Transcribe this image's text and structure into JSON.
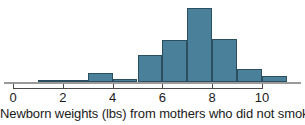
{
  "caption": "Newborn weights (lbs) from mothers who did not smoke",
  "colors": {
    "bar_fill": "#4a8099",
    "bar_stroke": "#2c4f60",
    "axis": "#4a4a4a",
    "baseline": "#9a9a9a",
    "text": "#1a1a1a",
    "background": "#ffffff"
  },
  "axis": {
    "tick_labels": [
      "0",
      "2",
      "4",
      "6",
      "8",
      "10"
    ],
    "tick_values": [
      0,
      2,
      4,
      6,
      8,
      10
    ],
    "xlim": [
      -0.4,
      11.4
    ]
  },
  "chart_data": {
    "type": "bar",
    "title": "",
    "subtitle": "",
    "xlabel": "Newborn weights (lbs) from mothers who did not smoke",
    "ylabel": "",
    "grid": false,
    "legend": "none",
    "bin_width": 1,
    "bin_edges": [
      1,
      2,
      3,
      4,
      5,
      6,
      7,
      8,
      9,
      10,
      11
    ],
    "categories": [
      "1-2",
      "2-3",
      "3-4",
      "4-5",
      "5-6",
      "6-7",
      "7-8",
      "8-9",
      "9-10",
      "10-11"
    ],
    "values": [
      2,
      2,
      9,
      3,
      28,
      44,
      77,
      45,
      14,
      6
    ],
    "ylim": [
      0,
      80
    ],
    "xlim": [
      0,
      11
    ],
    "xtick_labels": [
      "0",
      "2",
      "4",
      "6",
      "8",
      "10"
    ]
  }
}
